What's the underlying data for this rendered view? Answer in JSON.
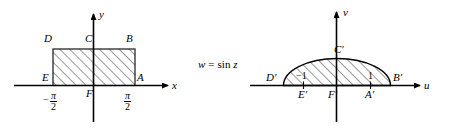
{
  "figure": {
    "background_color": "#ffffff",
    "line_color": "#000000",
    "width": 453,
    "height": 132
  },
  "mapping": {
    "equation_w": "w",
    "equation_eq": "=",
    "equation_fn": "sin",
    "equation_var": "z"
  },
  "z_plane": {
    "axes": {
      "x_label": "x",
      "y_label": "y"
    },
    "region_vertices": {
      "A": "A",
      "B": "B",
      "C": "C",
      "D": "D",
      "E": "E",
      "F": "F"
    },
    "ticks": {
      "left_numerator": "π",
      "left_denominator": "2",
      "left_sign": "−",
      "right_numerator": "π",
      "right_denominator": "2"
    }
  },
  "w_plane": {
    "axes": {
      "u_label": "u",
      "v_label": "v"
    },
    "region_vertices": {
      "A_prime": "A′",
      "B_prime": "B′",
      "C_prime": "C′",
      "D_prime": "D′",
      "E_prime": "E′",
      "F_prime": "F′"
    },
    "ticks": {
      "left": "−1",
      "right": "1"
    }
  }
}
